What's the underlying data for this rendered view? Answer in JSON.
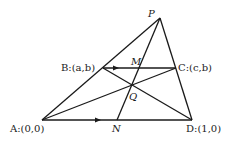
{
  "diagram": {
    "points": {
      "P": {
        "x": 160,
        "y": 18
      },
      "B": {
        "x": 103,
        "y": 68
      },
      "C": {
        "x": 176,
        "y": 68
      },
      "M": {
        "x": 138,
        "y": 68
      },
      "Q": {
        "x": 132,
        "y": 86
      },
      "A": {
        "x": 42,
        "y": 120
      },
      "N": {
        "x": 117,
        "y": 120
      },
      "D": {
        "x": 192,
        "y": 120
      }
    },
    "labels": {
      "P": "P",
      "B": "B:(a,b)",
      "C": "C:(c,b)",
      "M": "M",
      "Q": "Q",
      "A": "A:(0,0)",
      "N": "N",
      "D": "D:(1,0)"
    },
    "segments": [
      [
        "A",
        "P"
      ],
      [
        "P",
        "D"
      ],
      [
        "A",
        "D"
      ],
      [
        "B",
        "C"
      ],
      [
        "A",
        "C"
      ],
      [
        "B",
        "D"
      ],
      [
        "P",
        "N"
      ]
    ],
    "arrows": [
      {
        "on": "B-C",
        "at": {
          "x": 118,
          "y": 68
        },
        "direction": "right"
      },
      {
        "on": "A-D",
        "at": {
          "x": 100,
          "y": 120
        },
        "direction": "right"
      }
    ],
    "stroke_color": "#1a1a1a"
  }
}
